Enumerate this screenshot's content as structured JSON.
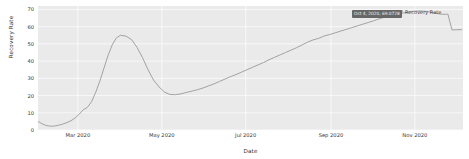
{
  "chart_data": {
    "type": "line",
    "title": "",
    "xlabel": "Date",
    "ylabel": "Recovery Rate",
    "grid": true,
    "legend_position": "top-right",
    "xlim": [
      "2020-02-01",
      "2020-12-06"
    ],
    "ylim": [
      0,
      72
    ],
    "yticks": [
      0,
      10,
      20,
      30,
      40,
      50,
      60,
      70
    ],
    "ytick_labels": [
      "0",
      "10",
      "20",
      "30",
      "40",
      "50",
      "60",
      "70"
    ],
    "xticks": [
      "2020-03-01",
      "2020-05-01",
      "2020-07-01",
      "2020-09-01",
      "2020-11-01"
    ],
    "xtick_labels": [
      "Mar 2020",
      "May 2020",
      "Jul 2020",
      "Sep 2020",
      "Nov 2020"
    ],
    "series": [
      {
        "name": "Recovery Rate",
        "color": "#9a9a9a",
        "x": [
          "2020-02-01",
          "2020-02-04",
          "2020-02-07",
          "2020-02-10",
          "2020-02-13",
          "2020-02-16",
          "2020-02-19",
          "2020-02-22",
          "2020-02-25",
          "2020-02-28",
          "2020-03-02",
          "2020-03-05",
          "2020-03-08",
          "2020-03-11",
          "2020-03-14",
          "2020-03-17",
          "2020-03-20",
          "2020-03-23",
          "2020-03-26",
          "2020-03-29",
          "2020-04-01",
          "2020-04-05",
          "2020-04-09",
          "2020-04-13",
          "2020-04-17",
          "2020-04-21",
          "2020-04-25",
          "2020-04-29",
          "2020-05-03",
          "2020-05-07",
          "2020-05-11",
          "2020-05-15",
          "2020-05-19",
          "2020-05-23",
          "2020-05-27",
          "2020-05-31",
          "2020-06-04",
          "2020-06-08",
          "2020-06-12",
          "2020-06-16",
          "2020-06-20",
          "2020-06-24",
          "2020-06-28",
          "2020-07-02",
          "2020-07-06",
          "2020-07-10",
          "2020-07-14",
          "2020-07-18",
          "2020-07-22",
          "2020-07-26",
          "2020-07-30",
          "2020-08-03",
          "2020-08-07",
          "2020-08-11",
          "2020-08-15",
          "2020-08-19",
          "2020-08-23",
          "2020-08-27",
          "2020-08-31",
          "2020-09-04",
          "2020-09-08",
          "2020-09-12",
          "2020-09-16",
          "2020-09-20",
          "2020-09-24",
          "2020-09-28",
          "2020-10-02",
          "2020-10-04",
          "2020-10-08",
          "2020-10-12",
          "2020-10-16",
          "2020-10-20",
          "2020-10-24",
          "2020-10-28",
          "2020-11-01",
          "2020-11-05",
          "2020-11-09",
          "2020-11-13",
          "2020-11-17",
          "2020-11-21",
          "2020-11-24",
          "2020-11-25",
          "2020-11-28",
          "2020-12-01",
          "2020-12-05"
        ],
        "y": [
          5.0,
          3.6,
          2.6,
          2.2,
          2.3,
          2.8,
          3.4,
          4.3,
          5.4,
          7.0,
          9.2,
          11.8,
          13.2,
          16.5,
          22.0,
          28.5,
          36.0,
          43.5,
          49.5,
          53.5,
          55.0,
          54.5,
          52.5,
          48.0,
          42.0,
          35.0,
          29.0,
          25.0,
          22.0,
          20.6,
          20.5,
          21.0,
          21.8,
          22.6,
          23.4,
          24.4,
          25.6,
          26.8,
          28.2,
          29.6,
          31.0,
          32.2,
          33.6,
          35.0,
          36.4,
          37.8,
          39.2,
          40.8,
          42.2,
          43.6,
          45.0,
          46.4,
          47.8,
          49.4,
          51.0,
          52.3,
          53.2,
          54.6,
          55.4,
          56.4,
          57.4,
          58.4,
          59.4,
          60.4,
          61.4,
          62.4,
          63.4,
          64.0,
          65.0,
          65.9,
          66.7,
          67.4,
          68.0,
          68.6,
          69.0,
          69.1,
          68.9,
          68.4,
          67.6,
          67.2,
          67.2,
          67.3,
          58.1,
          58.2,
          58.3
        ]
      }
    ],
    "annotation": {
      "type": "tooltip",
      "label": "Oct 4, 2020, 69.0728",
      "point_x": "2020-10-04",
      "point_y": 69.0728,
      "background": "#676767",
      "text_color": "#f2f2f2"
    }
  },
  "legend": {
    "entries": [
      {
        "label": "Recovery Rate",
        "color": "#b9b9b9"
      }
    ]
  },
  "style": {
    "plot_background": "#eaeaea",
    "grid_color": "#fbfbfb",
    "line_color": "#9a9a9a",
    "figure_background": "#ffffff",
    "tick_text_color": "#353535"
  }
}
